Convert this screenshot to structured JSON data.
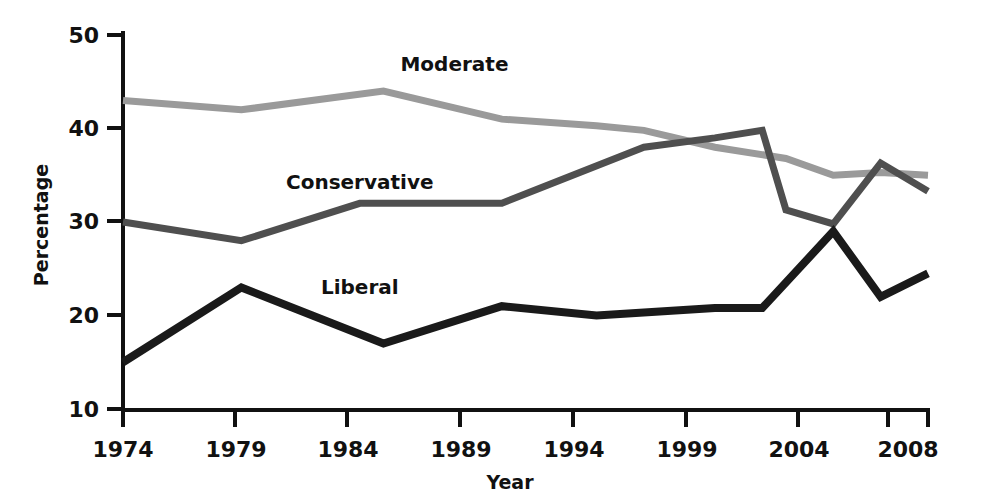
{
  "chart_data": {
    "type": "line",
    "title": "",
    "xlabel": "Year",
    "ylabel": "Percentage",
    "xlim": [
      1974,
      2008
    ],
    "ylim": [
      10,
      50
    ],
    "xticks": [
      1974,
      1979,
      1984,
      1989,
      1994,
      1999,
      2004,
      2008
    ],
    "yticks": [
      10,
      20,
      30,
      40,
      50
    ],
    "grid": false,
    "legend": "inline-labels",
    "series": [
      {
        "name": "Moderate",
        "color": "#9a9a9a",
        "label_x": 1988,
        "label_y": 46.2,
        "x": [
          1974,
          1979,
          1985,
          1990,
          1994,
          1996,
          1999,
          2002,
          2004,
          2006,
          2008
        ],
        "values": [
          43.0,
          42.0,
          44.0,
          41.0,
          40.3,
          39.8,
          38.0,
          36.8,
          35.0,
          35.3,
          35.0
        ]
      },
      {
        "name": "Conservative",
        "color": "#4f4f4f",
        "label_x": 1984,
        "label_y": 33.5,
        "x": [
          1974,
          1979,
          1984,
          1990,
          1996,
          1999,
          2001,
          2002,
          2004,
          2006,
          2008
        ],
        "values": [
          30.0,
          28.0,
          32.0,
          32.0,
          38.0,
          39.0,
          39.8,
          31.3,
          29.8,
          36.3,
          33.3
        ]
      },
      {
        "name": "Liberal",
        "color": "#1a1a1a",
        "label_x": 1984,
        "label_y": 22.3,
        "x": [
          1974,
          1979,
          1985,
          1990,
          1994,
          1999,
          2001,
          2004,
          2006,
          2008
        ],
        "values": [
          15.0,
          23.0,
          17.0,
          21.0,
          20.0,
          20.8,
          20.8,
          29.0,
          22.0,
          24.5
        ]
      }
    ]
  },
  "axes": {
    "x_tick_labels": [
      "1974",
      "1979",
      "1984",
      "1989",
      "1994",
      "1999",
      "2004",
      "2008"
    ],
    "y_tick_labels": [
      "10",
      "20",
      "30",
      "40",
      "50"
    ],
    "x_axis_title": "Year",
    "y_axis_title": "Percentage"
  },
  "series_labels": {
    "moderate": "Moderate",
    "conservative": "Conservative",
    "liberal": "Liberal"
  }
}
